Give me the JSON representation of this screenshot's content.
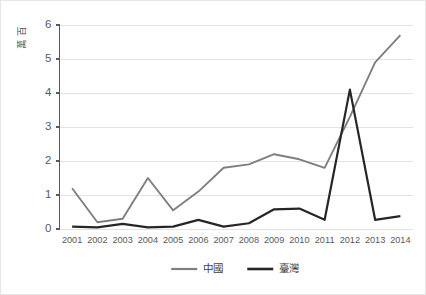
{
  "chart_data": {
    "type": "line",
    "title": "",
    "xlabel": "",
    "ylabel": "百萬",
    "categories": [
      "2001",
      "2002",
      "2003",
      "2004",
      "2005",
      "2006",
      "2007",
      "2008",
      "2009",
      "2010",
      "2011",
      "2012",
      "2013",
      "2014"
    ],
    "series": [
      {
        "name": "中國",
        "color": "#7f7f7f",
        "values": [
          1.2,
          0.2,
          0.3,
          1.5,
          0.55,
          1.1,
          1.8,
          1.9,
          2.2,
          2.05,
          1.8,
          3.3,
          4.9,
          5.7
        ]
      },
      {
        "name": "臺灣",
        "color": "#262626",
        "values": [
          0.07,
          0.05,
          0.15,
          0.05,
          0.07,
          0.27,
          0.07,
          0.17,
          0.58,
          0.6,
          0.27,
          4.1,
          0.27,
          0.38
        ]
      }
    ],
    "ylim": [
      0,
      6
    ],
    "yticks": [
      "0",
      "1",
      "2",
      "3",
      "4",
      "5",
      "6"
    ],
    "grid": true,
    "legend_position": "bottom"
  },
  "legend": {
    "entries": [
      {
        "label": "中國",
        "color": "#7f7f7f"
      },
      {
        "label": "臺灣",
        "color": "#262626"
      }
    ]
  },
  "axis": {
    "y_label": "百萬",
    "y_ticks": [
      "0",
      "1",
      "2",
      "3",
      "4",
      "5",
      "6"
    ],
    "x_ticks": [
      "2001",
      "2002",
      "2003",
      "2004",
      "2005",
      "2006",
      "2007",
      "2008",
      "2009",
      "2010",
      "2011",
      "2012",
      "2013",
      "2014"
    ]
  }
}
